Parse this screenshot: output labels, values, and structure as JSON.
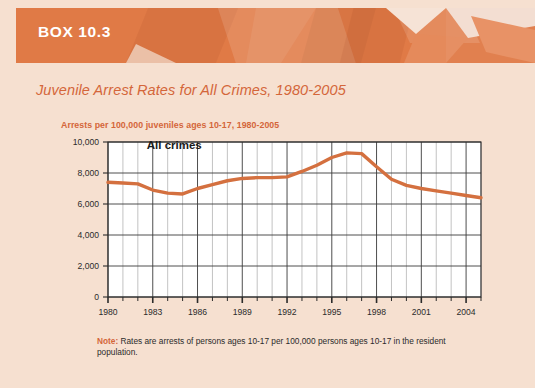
{
  "banner": {
    "box_label": "BOX 10.3",
    "banner_color": "#e07a46"
  },
  "chart_title": "Juvenile Arrest Rates for All Crimes, 1980-2005",
  "axis_heading": "Arrests per 100,000 juveniles ages 10-17, 1980-2005",
  "note": {
    "label": "Note:",
    "text": " Rates are arrests of persons ages 10-17 per 100,000 persons ages 10-17 in the resident population."
  },
  "chart_data": {
    "type": "line",
    "title": "Juvenile Arrest Rates for All Crimes, 1980-2005",
    "subtitle": "Arrests per 100,000 juveniles ages 10-17, 1980-2005",
    "xlabel": "",
    "ylabel": "Arrests per 100,000 juveniles ages 10-17",
    "ylim": [
      0,
      10000
    ],
    "xlim": [
      1980,
      2005
    ],
    "ytick_labels": [
      "0",
      "2,000",
      "4,000",
      "6,000",
      "8,000",
      "10,000"
    ],
    "yticks": [
      0,
      2000,
      4000,
      6000,
      8000,
      10000
    ],
    "xtick_labels": [
      "1980",
      "1983",
      "1986",
      "1989",
      "1992",
      "1995",
      "1998",
      "2001",
      "2004"
    ],
    "xticks": [
      1980,
      1983,
      1986,
      1989,
      1992,
      1995,
      1998,
      2001,
      2004
    ],
    "grid": true,
    "legend_position": "inside-top-left",
    "line_color": "#d4703f",
    "series": [
      {
        "name": "All crimes",
        "x": [
          1980,
          1981,
          1982,
          1983,
          1984,
          1985,
          1986,
          1987,
          1988,
          1989,
          1990,
          1991,
          1992,
          1993,
          1994,
          1995,
          1996,
          1997,
          1998,
          1999,
          2000,
          2001,
          2002,
          2003,
          2004,
          2005
        ],
        "values": [
          7400,
          7350,
          7300,
          6900,
          6700,
          6650,
          7000,
          7250,
          7500,
          7650,
          7700,
          7700,
          7750,
          8100,
          8500,
          9000,
          9300,
          9250,
          8400,
          7600,
          7200,
          7000,
          6850,
          6700,
          6550,
          6400
        ]
      }
    ],
    "annotations": [
      {
        "text": "All crimes",
        "x": 1982.6,
        "y": 9550
      }
    ]
  }
}
